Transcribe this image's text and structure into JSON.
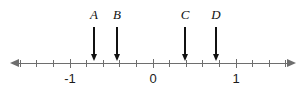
{
  "figure": {
    "title": "",
    "width": 306,
    "height": 91,
    "background_color": "#ffffff",
    "axis_color": "#6e6e6e",
    "pointer_color": "#111111",
    "label_color": "#1c1c1c"
  },
  "chart_data": {
    "type": "number-line",
    "title": "",
    "xlabel": "",
    "ylabel": "",
    "axis": {
      "orientation": "horizontal",
      "xlim": [
        -1.72,
        1.72
      ],
      "arrowheads": [
        "left",
        "right"
      ],
      "line_y_px": 63,
      "pixels_per_unit": 83,
      "origin_x_px": 153
    },
    "ticks": {
      "major_step": 1,
      "minor_step": 0.2,
      "major_values": [
        -1,
        0,
        1
      ],
      "major_labels": [
        "-1",
        "0",
        "1"
      ],
      "minor_values": [
        -1.6,
        -1.4,
        -1.2,
        -0.8,
        -0.6,
        -0.4,
        -0.2,
        0.2,
        0.4,
        0.6,
        0.8,
        1.2,
        1.4,
        1.6
      ],
      "grid": false
    },
    "annotations": [
      {
        "label": "A",
        "value": -0.7,
        "x_px": 94,
        "marker": "down-arrow"
      },
      {
        "label": "B",
        "value": -0.43,
        "x_px": 117,
        "marker": "down-arrow"
      },
      {
        "label": "C",
        "value": 0.38,
        "x_px": 185,
        "marker": "down-arrow"
      },
      {
        "label": "D",
        "value": 0.76,
        "x_px": 216,
        "marker": "down-arrow"
      }
    ],
    "legend": {
      "entries": [],
      "position": "none"
    }
  }
}
